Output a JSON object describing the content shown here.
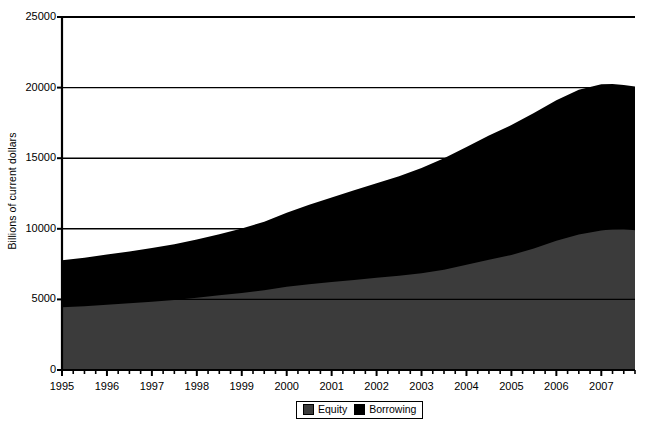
{
  "chart_data": {
    "type": "area",
    "stacked": true,
    "title": "",
    "subtitle": "",
    "xlabel": "",
    "ylabel": "Billions of current dollars",
    "ylim": [
      0,
      25000
    ],
    "xlim": [
      1995,
      2007.75
    ],
    "grid": "horizontal",
    "legend_position": "bottom-center",
    "ytick_labels": [
      "0",
      "5000",
      "10000",
      "15000",
      "20000",
      "25000"
    ],
    "ytick_values": [
      0,
      5000,
      10000,
      15000,
      20000,
      25000
    ],
    "xtick_labels": [
      "1995",
      "1996",
      "1997",
      "1998",
      "1999",
      "2000",
      "2001",
      "2002",
      "2003",
      "2004",
      "2005",
      "2006",
      "2007"
    ],
    "xtick_values": [
      1995,
      1996,
      1997,
      1998,
      1999,
      2000,
      2001,
      2002,
      2003,
      2004,
      2005,
      2006,
      2007
    ],
    "minor_ticks_per_year": 4,
    "x": [
      1995,
      1995.5,
      1996,
      1996.5,
      1997,
      1997.5,
      1998,
      1998.5,
      1999,
      1999.5,
      2000,
      2000.5,
      2001,
      2001.5,
      2002,
      2002.5,
      2003,
      2003.5,
      2004,
      2004.5,
      2005,
      2005.5,
      2006,
      2006.5,
      2007,
      2007.25,
      2007.5,
      2007.75
    ],
    "series": [
      {
        "name": "Equity",
        "color": "#3b3b3b",
        "values": [
          4450,
          4520,
          4620,
          4720,
          4830,
          4960,
          5120,
          5290,
          5460,
          5650,
          5900,
          6080,
          6230,
          6380,
          6530,
          6680,
          6850,
          7100,
          7450,
          7800,
          8150,
          8600,
          9150,
          9600,
          9880,
          9960,
          9980,
          9900
        ]
      },
      {
        "name": "Borrowing",
        "color": "#000000",
        "values": [
          3320,
          3430,
          3560,
          3680,
          3810,
          3950,
          4120,
          4330,
          4560,
          4850,
          5230,
          5620,
          5990,
          6350,
          6700,
          7050,
          7450,
          7900,
          8350,
          8800,
          9200,
          9600,
          9950,
          10250,
          10350,
          10290,
          10200,
          10170
        ]
      }
    ],
    "totals": [
      7770,
      7950,
      8180,
      8400,
      8640,
      8910,
      9240,
      9620,
      10020,
      10500,
      11130,
      11700,
      12220,
      12730,
      13230,
      13730,
      14300,
      15000,
      15800,
      16600,
      17350,
      18200,
      19100,
      19850,
      20230,
      20250,
      20180,
      20070
    ],
    "legend": [
      {
        "label": "Equity",
        "color": "#3b3b3b"
      },
      {
        "label": "Borrowing",
        "color": "#000000"
      }
    ]
  },
  "axis": {
    "axis_color": "#000000",
    "gridline_color": "#000000"
  }
}
